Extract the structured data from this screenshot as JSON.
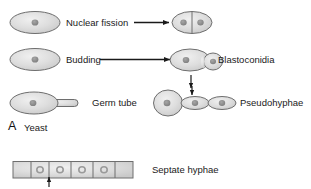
{
  "figure": {
    "panel_letter": "A",
    "panel_title": "Yeast",
    "background_color": "#ffffff",
    "cell_fill_color": "#d9d9d9",
    "cell_stroke_color": "#6e6e6e",
    "nucleus_color": "#8c8c8c",
    "arrow_color": "#1a1a1a",
    "text_color": "#1a1a1a"
  },
  "rows": {
    "nuclear_fission": {
      "label": "Nuclear fission",
      "left_cell": "yeast-cell-single",
      "right_cell": "yeast-cell-divided",
      "arrow": "arrow-right"
    },
    "budding": {
      "label": "Budding",
      "product_label": "Blastoconidia",
      "left_cell": "yeast-cell-single",
      "right_cell": "yeast-cell-budding",
      "arrow": "arrow-right",
      "down_arrow": "arrow-down"
    },
    "germ_tube": {
      "label": "Germ tube",
      "cell": "yeast-cell-with-germ-tube"
    },
    "pseudohyphae": {
      "label": "Pseudohyphae",
      "cell": "pseudohyphae-chain",
      "pointer_arrow": "arrow-down-constriction"
    },
    "septate_hyphae": {
      "label": "Septate hyphae",
      "shape": "hyphae-tube",
      "pointer_arrow": "arrow-up-septum",
      "septa_count": 5,
      "nuclei_count": 4
    }
  }
}
